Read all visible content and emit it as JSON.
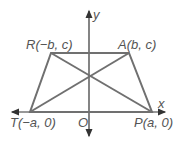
{
  "diagram": {
    "axes": {
      "x_label": "x",
      "y_label": "y",
      "origin_label": "O"
    },
    "vertices": [
      {
        "id": "R",
        "label": "R(−b, c)",
        "px": [
          51,
          53
        ]
      },
      {
        "id": "A",
        "label": "A(b, c)",
        "px": [
          129,
          53
        ]
      },
      {
        "id": "P",
        "label": "P(a, 0)",
        "px": [
          152,
          112
        ]
      },
      {
        "id": "T",
        "label": "T(−a, 0)",
        "px": [
          30,
          112
        ]
      }
    ],
    "segments": [
      "RA",
      "AP",
      "PT",
      "TR",
      "RP",
      "TA"
    ],
    "colors": {
      "shape_stroke": "#707070",
      "axis_stroke": "#333333",
      "label_text": "#555555"
    }
  }
}
